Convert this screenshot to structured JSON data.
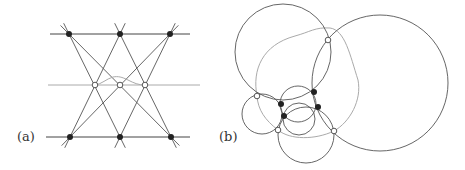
{
  "panels": [
    {
      "label": "(a)",
      "label_pos": [
        17,
        129
      ],
      "horizontal_lines": [
        {
          "y": 34,
          "x1": 50,
          "x2": 190,
          "color": "#444444"
        },
        {
          "y": 85,
          "x1": 48,
          "x2": 200,
          "color": "#aaaaaa"
        },
        {
          "y": 137,
          "x1": 46,
          "x2": 190,
          "color": "#444444"
        }
      ],
      "diagonals": [
        [
          [
            69,
            34
          ],
          [
            171,
            137
          ]
        ],
        [
          [
            69,
            34
          ],
          [
            120,
            137
          ]
        ],
        [
          [
            120,
            34
          ],
          [
            70,
            137
          ]
        ],
        [
          [
            120,
            34
          ],
          [
            171,
            137
          ]
        ],
        [
          [
            170,
            34
          ],
          [
            70,
            137
          ]
        ],
        [
          [
            170,
            34
          ],
          [
            120,
            137
          ]
        ]
      ],
      "filled_points": [
        [
          69,
          34
        ],
        [
          120,
          34
        ],
        [
          170,
          34
        ],
        [
          70,
          137
        ],
        [
          120,
          137
        ],
        [
          171,
          137
        ]
      ],
      "open_points": [
        [
          95,
          85
        ],
        [
          120,
          85
        ],
        [
          145,
          85
        ]
      ],
      "wiggle_path": "M 95 85 C 102 84, 106 79, 113 77 C 118 76, 122 77, 128 80 C 134 83, 138 85, 145 85"
    },
    {
      "label": "(b)",
      "label_pos": [
        219,
        129
      ],
      "circles": [
        {
          "cx": 283,
          "cy": 52,
          "r": 48,
          "color": "#555555"
        },
        {
          "cx": 380,
          "cy": 83,
          "r": 68,
          "color": "#555555"
        },
        {
          "cx": 262,
          "cy": 114,
          "r": 20,
          "color": "#555555"
        },
        {
          "cx": 298,
          "cy": 104,
          "r": 18,
          "color": "#555555"
        },
        {
          "cx": 299,
          "cy": 119,
          "r": 16,
          "color": "#555555"
        },
        {
          "cx": 306,
          "cy": 135,
          "r": 28,
          "color": "#555555"
        }
      ],
      "blob_path": "M 257 96 C 252 70, 262 45, 295 36 C 310 32, 315 27, 330 28 C 345 30, 350 55, 358 80 C 362 100, 350 122, 334 131 C 315 140, 290 140, 278 130 C 265 120, 258 110, 257 96 Z",
      "blob_color": "#aaaaaa",
      "filled_points": [
        [
          281,
          104
        ],
        [
          284,
          116
        ],
        [
          314,
          92
        ],
        [
          318,
          107
        ]
      ],
      "open_points": [
        [
          328,
          40
        ],
        [
          257,
          96
        ],
        [
          278,
          130
        ],
        [
          334,
          131
        ]
      ]
    }
  ]
}
